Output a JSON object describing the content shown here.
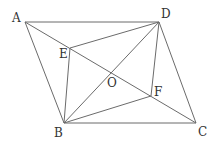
{
  "figure": {
    "line_color": "#6b6b6b",
    "points": {
      "A": {
        "label": "A",
        "x": 25,
        "y": 22
      },
      "B": {
        "label": "B",
        "x": 64,
        "y": 123
      },
      "C": {
        "label": "C",
        "x": 196,
        "y": 123
      },
      "D": {
        "label": "D",
        "x": 159,
        "y": 22
      },
      "E": {
        "label": "E",
        "x": 70,
        "y": 48
      },
      "F": {
        "label": "F",
        "x": 151,
        "y": 96
      },
      "O": {
        "label": "O",
        "x": 111,
        "y": 71
      }
    },
    "segments": [
      "AB",
      "BC",
      "CD",
      "DA",
      "AC",
      "BD",
      "BE",
      "BF",
      "DE",
      "DF"
    ]
  }
}
